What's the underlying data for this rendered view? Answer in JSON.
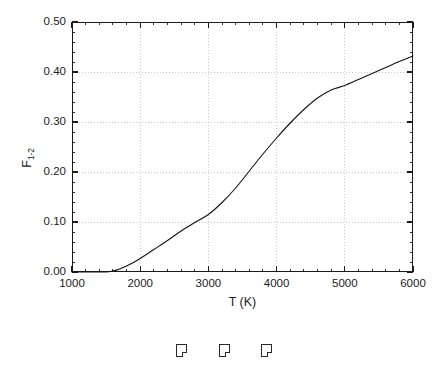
{
  "chart_data": {
    "type": "line",
    "title": "",
    "subtitle": "",
    "xlabel": "T (K)",
    "ylabel": "F",
    "ylabel_subscript": "1-2",
    "xlim": [
      1000,
      6000
    ],
    "ylim": [
      0.0,
      0.5
    ],
    "xticks": [
      1000,
      2000,
      3000,
      4000,
      5000,
      6000
    ],
    "xtick_labels": [
      "1000",
      "2000",
      "3000",
      "4000",
      "5000",
      "6000"
    ],
    "yticks": [
      0.0,
      0.1,
      0.2,
      0.3,
      0.4,
      0.5
    ],
    "ytick_labels": [
      "0.00",
      "0.10",
      "0.20",
      "0.30",
      "0.40",
      "0.50"
    ],
    "x_minor_tick_interval": 200,
    "y_minor_tick_interval": 0.02,
    "grid": true,
    "grid_style": "dotted",
    "grid_color": "#bdbdbd",
    "legend": null,
    "line_color": "#141414",
    "line_width": 1.1,
    "series": [
      {
        "name": "F_1-2",
        "x": [
          1000,
          1200,
          1400,
          1500,
          1600,
          1700,
          1800,
          1900,
          2000,
          2200,
          2400,
          2600,
          2800,
          3000,
          3200,
          3400,
          3600,
          3800,
          4000,
          4200,
          4400,
          4600,
          4800,
          5000,
          5200,
          5400,
          5600,
          5800,
          6000
        ],
        "values": [
          0.0,
          0.0,
          0.0,
          0.0,
          0.002,
          0.006,
          0.012,
          0.019,
          0.027,
          0.045,
          0.063,
          0.082,
          0.099,
          0.115,
          0.139,
          0.168,
          0.202,
          0.236,
          0.268,
          0.298,
          0.325,
          0.348,
          0.364,
          0.373,
          0.385,
          0.397,
          0.409,
          0.421,
          0.432
        ]
      }
    ]
  },
  "glyphs": {
    "boxes": [
      "missing-glyph-box",
      "missing-glyph-box",
      "missing-glyph-box"
    ]
  },
  "colors": {
    "axis": "#1b1b1b",
    "grid": "#bdbdbd",
    "curve": "#141414",
    "background": "#ffffff"
  }
}
